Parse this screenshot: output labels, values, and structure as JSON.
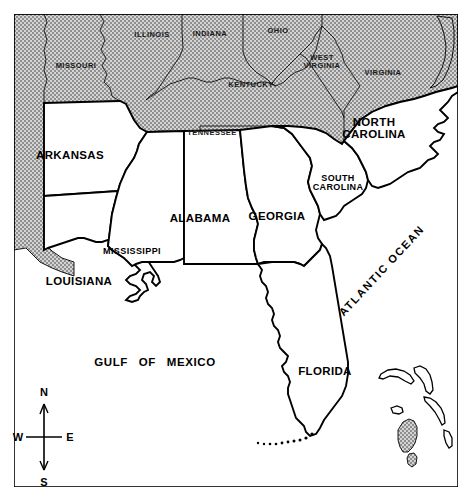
{
  "map": {
    "title": "Southeastern United States reference map",
    "frame": {
      "stroke": "#000000",
      "fill": "#ffffff"
    },
    "palette": {
      "shaded_state_fill": "#b9b9b9",
      "unshaded_state_fill": "#ffffff",
      "ocean_fill": "#ffffff",
      "outline": "#000000",
      "page_background": "#ffffff"
    },
    "shaded_states": [
      "MISSOURI",
      "ILLINOIS",
      "INDIANA",
      "OHIO",
      "KENTUCKY",
      "WEST VIRGINIA",
      "VIRGINIA",
      "TENNESSEE"
    ],
    "unshaded_states": [
      "ARKANSAS",
      "LOUISIANA",
      "MISSISSIPPI",
      "ALABAMA",
      "GEORGIA",
      "FLORIDA",
      "SOUTH CAROLINA",
      "NORTH CAROLINA"
    ],
    "state_labels": [
      {
        "name": "MISSOURI",
        "lines": [
          "MISSOURI"
        ],
        "x": 76,
        "y": 66,
        "size": "sz-sm",
        "shaded": true
      },
      {
        "name": "ILLINOIS",
        "lines": [
          "ILLINOIS"
        ],
        "x": 152,
        "y": 35,
        "size": "sz-sm",
        "shaded": true
      },
      {
        "name": "INDIANA",
        "lines": [
          "INDIANA"
        ],
        "x": 210,
        "y": 34,
        "size": "sz-sm",
        "shaded": true
      },
      {
        "name": "OHIO",
        "lines": [
          "OHIO"
        ],
        "x": 278,
        "y": 31,
        "size": "sz-sm",
        "shaded": true
      },
      {
        "name": "KENTUCKY",
        "lines": [
          "KENTUCKY"
        ],
        "x": 251,
        "y": 85,
        "size": "sz-sm",
        "shaded": true
      },
      {
        "name": "WEST VIRGINIA",
        "lines": [
          "WEST",
          "VIRGINIA"
        ],
        "x": 322,
        "y": 62,
        "size": "sz-sm",
        "shaded": true
      },
      {
        "name": "VIRGINIA",
        "lines": [
          "VIRGINIA"
        ],
        "x": 383,
        "y": 73,
        "size": "sz-sm",
        "shaded": true
      },
      {
        "name": "TENNESSEE",
        "lines": [
          "TENNESSEE"
        ],
        "x": 212,
        "y": 133,
        "size": "sz-sm",
        "shaded": true
      },
      {
        "name": "ARKANSAS",
        "lines": [
          "ARKANSAS"
        ],
        "x": 70,
        "y": 155,
        "size": "sz-lg",
        "shaded": false
      },
      {
        "name": "NORTH CAROLINA",
        "lines": [
          "NORTH",
          "CAROLINA"
        ],
        "x": 374,
        "y": 128,
        "size": "sz-lg",
        "shaded": false
      },
      {
        "name": "SOUTH CAROLINA",
        "lines": [
          "SOUTH",
          "CAROLINA"
        ],
        "x": 338,
        "y": 183,
        "size": "sz-md",
        "shaded": false
      },
      {
        "name": "ALABAMA",
        "lines": [
          "ALABAMA"
        ],
        "x": 200,
        "y": 218,
        "size": "sz-lg",
        "shaded": false
      },
      {
        "name": "GEORGIA",
        "lines": [
          "GEORGIA"
        ],
        "x": 277,
        "y": 216,
        "size": "sz-lg",
        "shaded": false
      },
      {
        "name": "MISSISSIPPI",
        "lines": [
          "MISSISSIPPI"
        ],
        "x": 132,
        "y": 252,
        "size": "sz-md",
        "shaded": false
      },
      {
        "name": "LOUISIANA",
        "lines": [
          "LOUISIANA"
        ],
        "x": 79,
        "y": 281,
        "size": "sz-lg",
        "shaded": false
      },
      {
        "name": "FLORIDA",
        "lines": [
          "FLORIDA"
        ],
        "x": 325,
        "y": 371,
        "size": "sz-lg",
        "shaded": false
      }
    ],
    "water_labels": [
      {
        "name": "GULF OF MEXICO",
        "text": "GULF OF MEXICO",
        "x": 155,
        "y": 362,
        "rotate": 0
      },
      {
        "name": "ATLANTIC OCEAN",
        "text": "ATLANTIC OCEAN",
        "x": 382,
        "y": 271,
        "rotate": -47
      }
    ],
    "compass": {
      "name": "compass-rose",
      "north": "N",
      "south": "S",
      "east": "E",
      "west": "W",
      "center_x": 44,
      "center_y": 437
    }
  }
}
